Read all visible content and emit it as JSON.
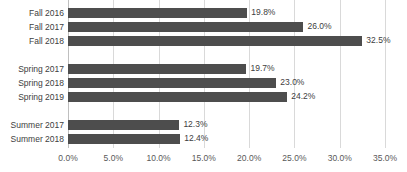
{
  "chart_data": {
    "type": "bar",
    "orientation": "horizontal",
    "title": "",
    "subtitle": "",
    "xlabel": "",
    "ylabel": "",
    "xlim": [
      0,
      35
    ],
    "grid": true,
    "legend": "none",
    "bar_color": "#4d4d4d",
    "gridline_color": "#d9d9d9",
    "text_color": "#404040",
    "tick_labels": [
      "0.0%",
      "5.0%",
      "10.0%",
      "15.0%",
      "20.0%",
      "25.0%",
      "30.0%",
      "35.0%"
    ],
    "tick_values": [
      0,
      5,
      10,
      15,
      20,
      25,
      30,
      35
    ],
    "categories": [
      "Fall 2016",
      "Fall 2017",
      "Fall 2018",
      "Spring 2017",
      "Spring 2018",
      "Spring 2019",
      "Summer 2017",
      "Summer 2018"
    ],
    "values": [
      19.8,
      26.0,
      32.5,
      19.7,
      23.0,
      24.2,
      12.3,
      12.4
    ],
    "data_labels": [
      "19.8%",
      "26.0%",
      "32.5%",
      "19.7%",
      "23.0%",
      "24.2%",
      "12.3%",
      "12.4%"
    ],
    "bars": [
      {
        "category": "Fall 2016",
        "value": 19.8,
        "label": "19.8%",
        "row": 0,
        "group": "Fall"
      },
      {
        "category": "Fall 2017",
        "value": 26.0,
        "label": "26.0%",
        "row": 1,
        "group": "Fall"
      },
      {
        "category": "Fall 2018",
        "value": 32.5,
        "label": "32.5%",
        "row": 2,
        "group": "Fall"
      },
      {
        "category": "Spring 2017",
        "value": 19.7,
        "label": "19.7%",
        "row": 4,
        "group": "Spring"
      },
      {
        "category": "Spring 2018",
        "value": 23.0,
        "label": "23.0%",
        "row": 5,
        "group": "Spring"
      },
      {
        "category": "Spring 2019",
        "value": 24.2,
        "label": "24.2%",
        "row": 6,
        "group": "Spring"
      },
      {
        "category": "Summer 2017",
        "value": 12.3,
        "label": "12.3%",
        "row": 8,
        "group": "Summer"
      },
      {
        "category": "Summer 2018",
        "value": 12.4,
        "label": "12.4%",
        "row": 9,
        "group": "Summer"
      }
    ]
  }
}
